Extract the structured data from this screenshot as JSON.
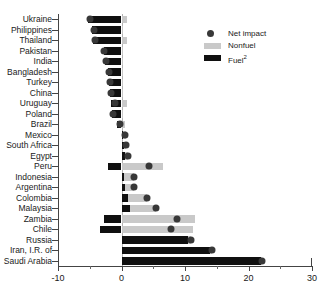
{
  "chart_data": {
    "type": "bar",
    "orientation": "horizontal",
    "title": "",
    "subtitle": "",
    "xlabel": "",
    "ylabel": "",
    "xlim": [
      -10,
      30
    ],
    "xticks": [
      -10,
      0,
      10,
      20,
      30
    ],
    "xtick_labels": [
      "-10",
      "0",
      "10",
      "20",
      "30"
    ],
    "xminor_ticks": [
      -5,
      5,
      15,
      25
    ],
    "grid": false,
    "zero_line": true,
    "legend": {
      "position": "top-right",
      "entries": [
        {
          "label": "Net impact",
          "marker": "dot",
          "color": "#383838"
        },
        {
          "label": "Nonfuel",
          "marker": "bar",
          "color": "#c9c9c9"
        },
        {
          "label": "Fuel",
          "marker": "bar",
          "color": "#101010",
          "superscript": "2"
        }
      ]
    },
    "categories": [
      "Ukraine",
      "Philippines",
      "Thailand",
      "Pakistan",
      "India",
      "Bangladesh",
      "Turkey",
      "China",
      "Uruguay",
      "Poland",
      "Brazil",
      "Mexico",
      "South Africa",
      "Egypt",
      "Peru",
      "Indonesia",
      "Argentina",
      "Colombia",
      "Malaysia",
      "Zambia",
      "Chile",
      "Russia",
      "Iran, I.R. of",
      "Saudi Arabia"
    ],
    "series": [
      {
        "name": "Fuel",
        "color": "#101010",
        "values": [
          -5.3,
          -4.6,
          -4.5,
          -2.7,
          -2.6,
          -2.1,
          -1.9,
          -1.8,
          -1.6,
          -1.5,
          -0.7,
          0.2,
          0.4,
          0.6,
          -2.2,
          0.4,
          0.6,
          1.1,
          1.4,
          -2.8,
          -3.4,
          10.5,
          14.0,
          22.0
        ]
      },
      {
        "name": "Nonfuel",
        "color": "#c9c9c9",
        "values": [
          0.9,
          0.3,
          0.8,
          0.1,
          0.2,
          0.2,
          0.3,
          0.2,
          0.8,
          0.3,
          0.6,
          0.5,
          0.3,
          0.4,
          6.5,
          1.5,
          1.4,
          2.9,
          4.0,
          11.5,
          11.2,
          0.4,
          0.3,
          0.2
        ]
      }
    ],
    "net_impact": {
      "name": "Net impact",
      "color": "#383838",
      "values": [
        -4.9,
        -4.4,
        -4.2,
        -2.7,
        -2.5,
        -2.0,
        -1.8,
        -1.7,
        -1.1,
        -1.3,
        -0.3,
        0.6,
        0.7,
        1.0,
        4.3,
        1.9,
        2.0,
        4.0,
        5.4,
        8.7,
        7.8,
        10.9,
        14.3,
        22.2
      ]
    }
  }
}
